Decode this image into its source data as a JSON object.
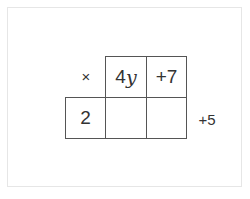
{
  "diagram": {
    "type": "area-model-multiplication",
    "operator": "×",
    "top_row": [
      {
        "coefficient": "4",
        "variable": "y"
      },
      {
        "text": "+7"
      }
    ],
    "left_column": [
      {
        "text": "2"
      }
    ],
    "product_cells": [
      {
        "text": ""
      },
      {
        "text": ""
      }
    ],
    "side_annotation": "+5"
  },
  "colors": {
    "border": "#555555",
    "frame": "#e6e6e6",
    "text": "#333333"
  }
}
